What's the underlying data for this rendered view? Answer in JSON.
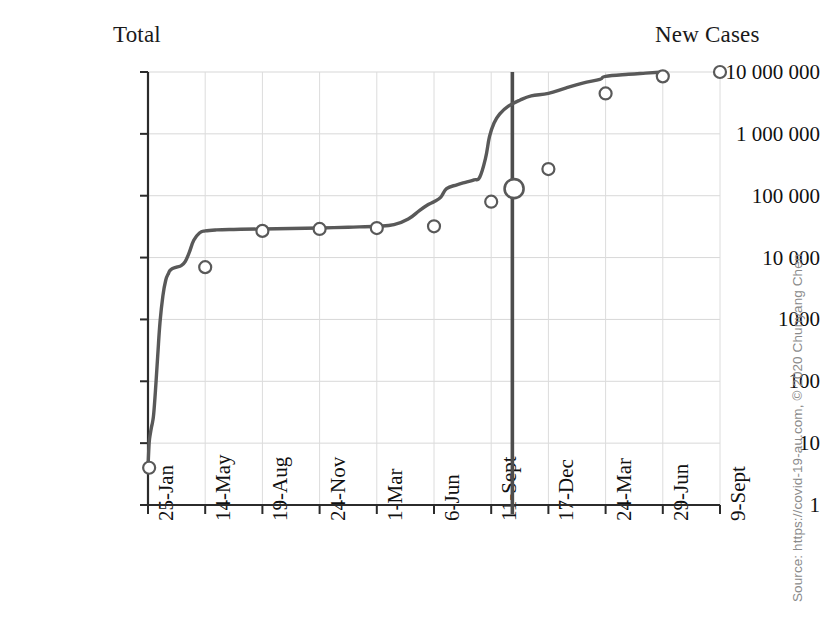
{
  "page": {
    "background": "#ffffff",
    "width": 832,
    "height": 625
  },
  "title_cutoff": "COVID-19 World Total Cases",
  "captions": {
    "left_label": "Total",
    "right_label": "New Cases"
  },
  "source": {
    "text": "Source: https://covid-19-au.com, © 2020 Chunyang Chen",
    "color": "#8a8a8a"
  },
  "chart_data": {
    "type": "line",
    "title": "",
    "xlabel": "",
    "ylabel": "",
    "yscale": "log",
    "ylim": [
      1,
      10000000
    ],
    "grid": true,
    "legend_position": "top",
    "yticks": [
      1,
      10,
      100,
      1000,
      10000,
      100000,
      1000000,
      10000000
    ],
    "ytick_labels": [
      "1",
      "10",
      "100",
      "1000",
      "10 000",
      "100 000",
      "1 000 000",
      "10 000 000"
    ],
    "categories": [
      "25-Jan",
      "14-May",
      "19-Aug",
      "24-Nov",
      "1-Mar",
      "6-Jun",
      "11-Sept",
      "17-Dec",
      "24-Mar",
      "29-Jun",
      "9-Sept"
    ],
    "series": [
      {
        "name": "Total",
        "color": "#595959",
        "marker": "circle-open",
        "values": [
          4,
          7000,
          27000,
          29000,
          30000,
          32000,
          80000,
          270000,
          4500000,
          8500000,
          10000000
        ]
      }
    ],
    "dense_curve": [
      [
        0.0,
        4
      ],
      [
        0.02,
        10
      ],
      [
        0.04,
        14
      ],
      [
        0.06,
        18
      ],
      [
        0.08,
        22
      ],
      [
        0.1,
        30
      ],
      [
        0.13,
        70
      ],
      [
        0.17,
        260
      ],
      [
        0.21,
        900
      ],
      [
        0.26,
        2400
      ],
      [
        0.31,
        4300
      ],
      [
        0.36,
        5600
      ],
      [
        0.4,
        6400
      ],
      [
        0.5,
        7000
      ],
      [
        0.58,
        7400
      ],
      [
        0.65,
        8600
      ],
      [
        0.72,
        12000
      ],
      [
        0.8,
        19000
      ],
      [
        0.9,
        25000
      ],
      [
        1.0,
        27000
      ],
      [
        1.2,
        28000
      ],
      [
        1.5,
        28500
      ],
      [
        2.0,
        29000
      ],
      [
        2.5,
        29500
      ],
      [
        3.0,
        30000
      ],
      [
        3.5,
        31000
      ],
      [
        4.0,
        32000
      ],
      [
        4.3,
        34000
      ],
      [
        4.55,
        42000
      ],
      [
        4.75,
        58000
      ],
      [
        4.9,
        72000
      ],
      [
        5.0,
        80000
      ],
      [
        5.12,
        95000
      ],
      [
        5.22,
        130000
      ],
      [
        5.4,
        150000
      ],
      [
        5.55,
        165000
      ],
      [
        5.7,
        180000
      ],
      [
        5.8,
        200000
      ],
      [
        5.9,
        400000
      ],
      [
        5.97,
        900000
      ],
      [
        6.05,
        1500000
      ],
      [
        6.15,
        2100000
      ],
      [
        6.3,
        2800000
      ],
      [
        6.5,
        3500000
      ],
      [
        6.7,
        4100000
      ],
      [
        7.0,
        4500000
      ],
      [
        7.3,
        5500000
      ],
      [
        7.6,
        6600000
      ],
      [
        7.9,
        7600000
      ],
      [
        8.0,
        8500000
      ],
      [
        8.4,
        9200000
      ],
      [
        8.7,
        9600000
      ],
      [
        9.0,
        10000000
      ]
    ],
    "markers": [
      {
        "index": 0,
        "x_frac": 0.02,
        "value": 4,
        "size": "small"
      },
      {
        "index": 1,
        "x_frac": 1.0,
        "value": 7000,
        "size": "small"
      },
      {
        "index": 2,
        "x_frac": 2.0,
        "value": 27000,
        "size": "small"
      },
      {
        "index": 3,
        "x_frac": 3.0,
        "value": 29000,
        "size": "small"
      },
      {
        "index": 4,
        "x_frac": 4.0,
        "value": 30000,
        "size": "small"
      },
      {
        "index": 5,
        "x_frac": 5.0,
        "value": 32000,
        "size": "small"
      },
      {
        "index": 6,
        "x_frac": 6.0,
        "value": 80000,
        "size": "small"
      },
      {
        "index": 7,
        "x_frac": 6.4,
        "value": 130000,
        "size": "large"
      },
      {
        "index": 8,
        "x_frac": 7.0,
        "value": 270000,
        "size": "small"
      },
      {
        "index": 9,
        "x_frac": 8.0,
        "value": 4500000,
        "size": "small"
      },
      {
        "index": 10,
        "x_frac": 9.0,
        "value": 8500000,
        "size": "small"
      },
      {
        "index": 11,
        "x_frac": 10.0,
        "value": 10000000,
        "size": "small"
      }
    ],
    "vertical_marker": {
      "x_frac": 6.37,
      "color": "#4d4d4d",
      "label": ""
    },
    "annotations": []
  }
}
